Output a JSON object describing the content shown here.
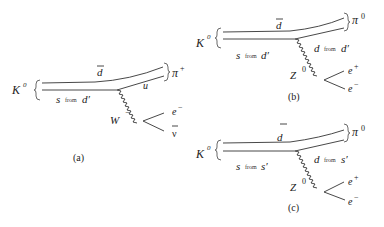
{
  "diagrams": [
    {
      "id": "a",
      "caption": "(a)",
      "initial": {
        "label": "K",
        "sup": "0"
      },
      "final": {
        "label": "π",
        "sup": "+"
      },
      "top_quark": {
        "label": "d",
        "bar": true
      },
      "lower_in": {
        "label": "s",
        "mid": "from",
        "tail": "d′"
      },
      "lower_out": {
        "label": "u"
      },
      "boson": {
        "label": "W",
        "sup": "−"
      },
      "lepton1": {
        "label": "e",
        "sup": "−"
      },
      "lepton2": {
        "label": "ν",
        "bar": true
      }
    },
    {
      "id": "b",
      "caption": "(b)",
      "initial": {
        "label": "K",
        "sup": "0"
      },
      "final": {
        "label": "π",
        "sup": "0"
      },
      "top_quark": {
        "label": "d",
        "bar": true
      },
      "lower_in": {
        "label": "s",
        "mid": "from",
        "tail": "d′"
      },
      "lower_out": {
        "label": "d",
        "mid": "from",
        "tail": "d′"
      },
      "boson": {
        "label": "Z",
        "sup": "0"
      },
      "lepton1": {
        "label": "e",
        "sup": "+"
      },
      "lepton2": {
        "label": "e",
        "sup": "−"
      }
    },
    {
      "id": "c",
      "caption": "(c)",
      "initial": {
        "label": "K",
        "sup": "0"
      },
      "final": {
        "label": "π",
        "sup": "0"
      },
      "top_quark": {
        "label": "d",
        "bar": true
      },
      "lower_in": {
        "label": "s",
        "mid": "from",
        "tail": "s′"
      },
      "lower_out": {
        "label": "d",
        "mid": "from",
        "tail": "s′"
      },
      "boson": {
        "label": "Z",
        "sup": "0"
      },
      "lepton1": {
        "label": "e",
        "sup": "+"
      },
      "lepton2": {
        "label": "e",
        "sup": "−"
      }
    }
  ]
}
